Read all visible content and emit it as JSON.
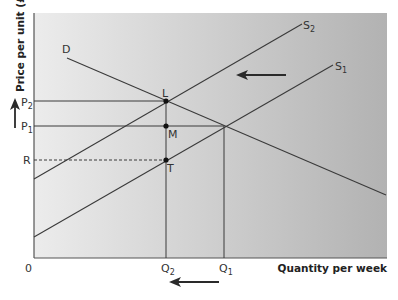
{
  "diagram": {
    "type": "supply-demand",
    "y_axis_label": "Price per unit (£)",
    "x_axis_label": "Quantity per week",
    "origin_label": "0",
    "curves": {
      "demand": "D",
      "supply_original": "S",
      "supply_original_sub": "1",
      "supply_shifted": "S",
      "supply_shifted_sub": "2"
    },
    "price_labels": {
      "p2": "P",
      "p2_sub": "2",
      "p1": "P",
      "p1_sub": "1",
      "r": "R"
    },
    "quantity_labels": {
      "q2": "Q",
      "q2_sub": "2",
      "q1": "Q",
      "q1_sub": "1"
    },
    "points": {
      "l": "L",
      "m": "M",
      "t": "T"
    },
    "arrows": {
      "supply_shift": "left",
      "price_change": "up",
      "quantity_change": "left"
    },
    "colors": {
      "background_light": "#ececec",
      "background_dark": "#b4b4b4",
      "line": "#3a3a3a",
      "arrow": "#2a2a2a"
    }
  }
}
